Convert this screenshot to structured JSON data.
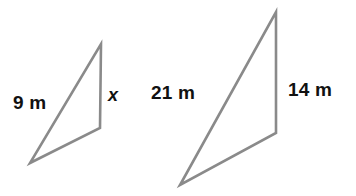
{
  "figure": {
    "background_color": "#ffffff",
    "stroke_color": "#8a8a8a",
    "stroke_width": 2.6,
    "text_color": "#111111",
    "units": "m",
    "shapes": [
      {
        "name": "small-triangle",
        "points": "101,44 100,128 30,163",
        "vertices": [
          {
            "label": "apex",
            "x": 101,
            "y": 44
          },
          {
            "label": "right-base",
            "x": 100,
            "y": 128
          },
          {
            "label": "left-base",
            "x": 30,
            "y": 163
          }
        ]
      },
      {
        "name": "large-triangle",
        "points": "276,12 276,133 180,185",
        "vertices": [
          {
            "label": "apex",
            "x": 276,
            "y": 12
          },
          {
            "label": "right-base",
            "x": 276,
            "y": 133
          },
          {
            "label": "left-base",
            "x": 180,
            "y": 185
          }
        ]
      }
    ],
    "labels": {
      "small_hypotenuse": "9 m",
      "small_vertical": "x",
      "large_hypotenuse": "21 m",
      "large_vertical": "14 m"
    }
  }
}
